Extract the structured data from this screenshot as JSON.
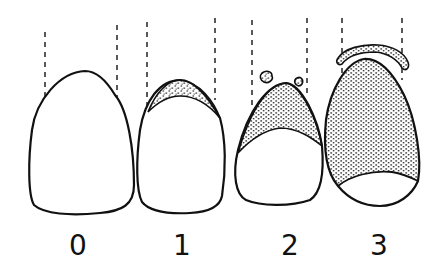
{
  "figure": {
    "type": "dental plaque index scoring diagram",
    "stroke_color": "#111111",
    "background": "#ffffff",
    "teeth": [
      {
        "score_label": "0",
        "plaque_coverage": "none"
      },
      {
        "score_label": "1",
        "plaque_coverage": "thin film at incisal/gingival margin"
      },
      {
        "score_label": "2",
        "plaque_coverage": "moderate accumulation, about one third"
      },
      {
        "score_label": "3",
        "plaque_coverage": "abundant, covering most of surface"
      }
    ]
  }
}
